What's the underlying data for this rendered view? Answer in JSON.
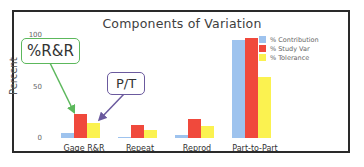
{
  "chart_data": {
    "type": "bar",
    "title": "Components of Variation",
    "xlabel": "",
    "ylabel": "Percent",
    "ylim": [
      0,
      100
    ],
    "yticks": [
      "0",
      "50",
      "100"
    ],
    "grid": false,
    "legend_position": "top-right",
    "categories": [
      "Gage R&R",
      "Repeat",
      "Reprod",
      "Part-to-Part"
    ],
    "series": [
      {
        "name": "% Contribution",
        "color": "#9ec3ee",
        "values": [
          5,
          1,
          3,
          95
        ]
      },
      {
        "name": "% Study Var",
        "color": "#f0493c",
        "values": [
          23,
          13,
          18,
          97
        ]
      },
      {
        "name": "% Tolerance",
        "color": "#fbf250",
        "values": [
          15,
          8,
          12,
          59
        ]
      }
    ],
    "annotations": [
      {
        "label": "%R&R",
        "points_to": "Gage R&R % Study Var",
        "color": "#5cb85c"
      },
      {
        "label": "P/T",
        "points_to": "Gage R&R % Tolerance",
        "color": "#6b5a9e"
      }
    ]
  }
}
